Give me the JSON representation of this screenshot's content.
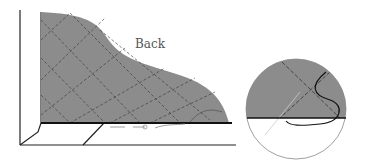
{
  "diagram": {
    "label": "Back",
    "colors": {
      "fabric": "#8c8c8c",
      "line": "#222222",
      "background": "#ffffff"
    }
  }
}
